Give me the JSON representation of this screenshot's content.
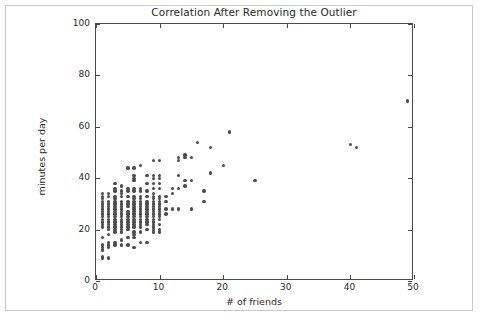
{
  "chart_data": {
    "type": "scatter",
    "title": "Correlation After Removing the Outlier",
    "xlabel": "# of friends",
    "ylabel": "minutes per day",
    "xlim": [
      0,
      50
    ],
    "ylim": [
      0,
      100
    ],
    "xticks": [
      0,
      10,
      20,
      30,
      40,
      50
    ],
    "yticks": [
      0,
      20,
      40,
      60,
      80,
      100
    ],
    "xticklabels": [
      "0",
      "10",
      "20",
      "30",
      "40",
      "50"
    ],
    "yticklabels": [
      "0",
      "20",
      "40",
      "60",
      "80",
      "100"
    ],
    "grid": false,
    "legend": null,
    "marker": {
      "shape": "circle",
      "color": "#4c4c4c",
      "size": 3.4
    },
    "series": [
      {
        "name": "users",
        "points": [
          [
            1,
            9
          ],
          [
            1,
            9.5
          ],
          [
            1,
            12
          ],
          [
            1,
            13
          ],
          [
            1,
            14
          ],
          [
            1,
            17
          ],
          [
            1,
            21
          ],
          [
            1,
            22
          ],
          [
            1,
            23
          ],
          [
            1,
            24
          ],
          [
            1,
            25
          ],
          [
            1,
            26
          ],
          [
            1,
            27
          ],
          [
            1,
            28
          ],
          [
            1,
            29
          ],
          [
            1,
            30
          ],
          [
            1,
            31
          ],
          [
            1,
            32
          ],
          [
            1,
            33
          ],
          [
            1,
            34
          ],
          [
            2,
            9
          ],
          [
            2,
            13
          ],
          [
            2,
            14
          ],
          [
            2,
            15
          ],
          [
            2,
            18
          ],
          [
            2,
            20
          ],
          [
            2,
            21
          ],
          [
            2,
            22
          ],
          [
            2,
            23
          ],
          [
            2,
            24
          ],
          [
            2,
            25
          ],
          [
            2,
            26
          ],
          [
            2,
            27
          ],
          [
            2,
            28
          ],
          [
            2,
            29
          ],
          [
            2,
            30
          ],
          [
            2,
            31
          ],
          [
            2,
            33
          ],
          [
            2,
            34
          ],
          [
            3,
            14
          ],
          [
            3,
            15
          ],
          [
            3,
            19
          ],
          [
            3,
            20
          ],
          [
            3,
            21
          ],
          [
            3,
            22
          ],
          [
            3,
            23
          ],
          [
            3,
            24
          ],
          [
            3,
            25
          ],
          [
            3,
            26
          ],
          [
            3,
            27
          ],
          [
            3,
            28
          ],
          [
            3,
            29
          ],
          [
            3,
            30
          ],
          [
            3,
            31
          ],
          [
            3,
            32
          ],
          [
            3,
            33
          ],
          [
            3,
            35
          ],
          [
            3,
            36
          ],
          [
            3,
            38
          ],
          [
            4,
            14
          ],
          [
            4,
            16
          ],
          [
            4,
            19
          ],
          [
            4,
            20
          ],
          [
            4,
            21
          ],
          [
            4,
            22
          ],
          [
            4,
            23
          ],
          [
            4,
            24
          ],
          [
            4,
            25
          ],
          [
            4,
            26
          ],
          [
            4,
            27
          ],
          [
            4,
            28
          ],
          [
            4,
            29
          ],
          [
            4,
            30
          ],
          [
            4,
            31
          ],
          [
            4,
            33
          ],
          [
            4,
            34
          ],
          [
            4,
            35
          ],
          [
            4,
            37
          ],
          [
            5,
            14
          ],
          [
            5,
            17
          ],
          [
            5,
            20
          ],
          [
            5,
            21
          ],
          [
            5,
            22
          ],
          [
            5,
            23
          ],
          [
            5,
            24
          ],
          [
            5,
            25
          ],
          [
            5,
            26
          ],
          [
            5,
            27
          ],
          [
            5,
            29
          ],
          [
            5,
            30
          ],
          [
            5,
            31
          ],
          [
            5,
            33
          ],
          [
            5,
            35
          ],
          [
            5,
            36
          ],
          [
            5,
            44
          ],
          [
            6,
            13
          ],
          [
            6,
            17
          ],
          [
            6,
            18
          ],
          [
            6,
            19
          ],
          [
            6,
            21
          ],
          [
            6,
            22
          ],
          [
            6,
            23
          ],
          [
            6,
            24
          ],
          [
            6,
            25
          ],
          [
            6,
            26
          ],
          [
            6,
            27
          ],
          [
            6,
            28
          ],
          [
            6,
            29
          ],
          [
            6,
            30
          ],
          [
            6,
            31
          ],
          [
            6,
            32
          ],
          [
            6,
            33
          ],
          [
            6,
            35
          ],
          [
            6,
            36
          ],
          [
            6,
            39
          ],
          [
            6,
            40
          ],
          [
            6,
            41
          ],
          [
            6,
            44
          ],
          [
            7,
            15
          ],
          [
            7,
            19
          ],
          [
            7,
            21
          ],
          [
            7,
            22
          ],
          [
            7,
            23
          ],
          [
            7,
            24
          ],
          [
            7,
            25
          ],
          [
            7,
            26
          ],
          [
            7,
            27
          ],
          [
            7,
            28
          ],
          [
            7,
            29
          ],
          [
            7,
            30
          ],
          [
            7,
            31
          ],
          [
            7,
            32
          ],
          [
            7,
            33
          ],
          [
            7,
            35
          ],
          [
            7,
            36
          ],
          [
            7,
            45
          ],
          [
            8,
            15
          ],
          [
            8,
            20
          ],
          [
            8,
            22
          ],
          [
            8,
            23
          ],
          [
            8,
            24
          ],
          [
            8,
            25
          ],
          [
            8,
            26
          ],
          [
            8,
            27
          ],
          [
            8,
            28
          ],
          [
            8,
            29
          ],
          [
            8,
            30
          ],
          [
            8,
            31
          ],
          [
            8,
            33
          ],
          [
            8,
            35
          ],
          [
            8,
            38
          ],
          [
            8,
            41
          ],
          [
            9,
            19
          ],
          [
            9,
            20
          ],
          [
            9,
            21
          ],
          [
            9,
            22
          ],
          [
            9,
            23
          ],
          [
            9,
            24
          ],
          [
            9,
            25
          ],
          [
            9,
            26
          ],
          [
            9,
            27
          ],
          [
            9,
            28
          ],
          [
            9,
            29
          ],
          [
            9,
            30
          ],
          [
            9,
            31
          ],
          [
            9,
            32
          ],
          [
            9,
            33
          ],
          [
            9,
            34
          ],
          [
            9,
            36
          ],
          [
            9,
            38
          ],
          [
            9,
            40
          ],
          [
            9,
            41
          ],
          [
            9,
            47
          ],
          [
            10,
            19
          ],
          [
            10,
            20
          ],
          [
            10,
            22
          ],
          [
            10,
            24
          ],
          [
            10,
            25
          ],
          [
            10,
            26
          ],
          [
            10,
            27
          ],
          [
            10,
            28
          ],
          [
            10,
            29
          ],
          [
            10,
            30
          ],
          [
            10,
            31
          ],
          [
            10,
            32
          ],
          [
            10,
            33
          ],
          [
            10,
            36
          ],
          [
            10,
            38
          ],
          [
            10,
            40
          ],
          [
            10,
            41
          ],
          [
            10,
            47
          ],
          [
            11,
            26
          ],
          [
            11,
            28
          ],
          [
            11,
            31
          ],
          [
            11,
            33
          ],
          [
            12,
            28
          ],
          [
            12,
            34
          ],
          [
            12,
            36
          ],
          [
            13,
            28
          ],
          [
            13,
            36
          ],
          [
            13,
            41
          ],
          [
            13,
            47
          ],
          [
            13,
            48
          ],
          [
            14,
            37
          ],
          [
            14,
            39
          ],
          [
            14,
            48
          ],
          [
            14,
            49
          ],
          [
            15,
            28
          ],
          [
            15,
            39
          ],
          [
            15,
            48
          ],
          [
            16,
            54
          ],
          [
            17,
            31
          ],
          [
            17,
            35
          ],
          [
            18,
            42
          ],
          [
            18,
            52
          ],
          [
            20,
            45
          ],
          [
            21,
            58
          ],
          [
            25,
            39
          ],
          [
            40,
            53
          ],
          [
            41,
            52
          ],
          [
            49,
            70
          ]
        ]
      }
    ]
  }
}
